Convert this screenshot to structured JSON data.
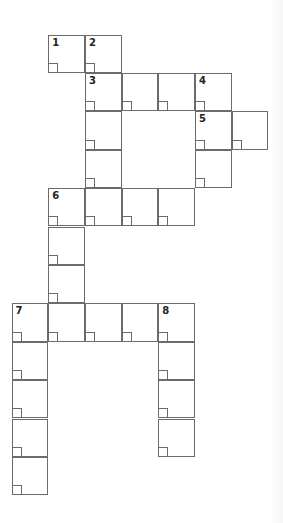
{
  "puzzle": {
    "type": "crossword",
    "grid_origin": {
      "x": 12,
      "y": 35
    },
    "cell_size": {
      "w": 36.7,
      "h": 38.4
    },
    "border_color": "#6b6b6b",
    "cells": [
      {
        "r": 0,
        "c": 1,
        "num": "1"
      },
      {
        "r": 0,
        "c": 2,
        "num": "2"
      },
      {
        "r": 1,
        "c": 2,
        "num": "3"
      },
      {
        "r": 1,
        "c": 3
      },
      {
        "r": 1,
        "c": 4
      },
      {
        "r": 1,
        "c": 5,
        "num": "4"
      },
      {
        "r": 2,
        "c": 2
      },
      {
        "r": 2,
        "c": 5,
        "num": "5"
      },
      {
        "r": 2,
        "c": 6
      },
      {
        "r": 3,
        "c": 2
      },
      {
        "r": 3,
        "c": 5
      },
      {
        "r": 4,
        "c": 1,
        "num": "6"
      },
      {
        "r": 4,
        "c": 2
      },
      {
        "r": 4,
        "c": 3
      },
      {
        "r": 4,
        "c": 4
      },
      {
        "r": 5,
        "c": 1
      },
      {
        "r": 6,
        "c": 1
      },
      {
        "r": 7,
        "c": 0,
        "num": "7"
      },
      {
        "r": 7,
        "c": 1
      },
      {
        "r": 7,
        "c": 2
      },
      {
        "r": 7,
        "c": 3
      },
      {
        "r": 7,
        "c": 4,
        "num": "8"
      },
      {
        "r": 8,
        "c": 0
      },
      {
        "r": 8,
        "c": 4
      },
      {
        "r": 9,
        "c": 0
      },
      {
        "r": 9,
        "c": 4
      },
      {
        "r": 10,
        "c": 0
      },
      {
        "r": 10,
        "c": 4
      },
      {
        "r": 11,
        "c": 0
      }
    ]
  }
}
